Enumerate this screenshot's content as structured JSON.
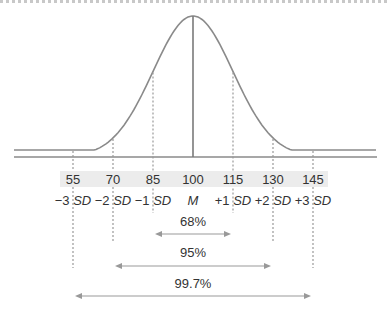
{
  "chart_data": {
    "type": "diagram",
    "values": [
      55,
      70,
      85,
      100,
      115,
      130,
      145
    ],
    "sd_labels": [
      {
        "num": "−3",
        "unit": "SD"
      },
      {
        "num": "−2",
        "unit": "SD"
      },
      {
        "num": "−1",
        "unit": "SD"
      },
      {
        "num": "",
        "unit": "M"
      },
      {
        "num": "+1",
        "unit": "SD"
      },
      {
        "num": "+2",
        "unit": "SD"
      },
      {
        "num": "+3",
        "unit": "SD"
      }
    ],
    "ranges": [
      {
        "label": "68%",
        "from": 85,
        "to": 115
      },
      {
        "label": "95%",
        "from": 70,
        "to": 130
      },
      {
        "label": "99.7%",
        "from": 55,
        "to": 145
      }
    ],
    "mean": 100,
    "sd": 15
  }
}
